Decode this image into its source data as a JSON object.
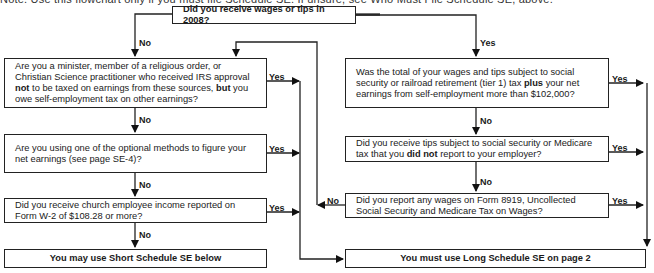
{
  "header_text": "Note. Use this flowchart only if you must file Schedule SE. If unsure, see Who Must File Schedule SE, above.",
  "flowchart": {
    "start": {
      "text": "Did you receive wages or tips in 2008?"
    },
    "left_column": [
      {
        "id": "minister",
        "parts": [
          "Are you a minister, member of a religious order, or Christian Science practitioner who received IRS approval ",
          "not",
          " to be taxed on earnings from these sources, ",
          "but",
          " you owe self-employment tax on other earnings?"
        ]
      },
      {
        "id": "optional-methods",
        "parts": [
          "Are you using one of the optional methods to figure your net earnings (see page SE-4)?"
        ]
      },
      {
        "id": "church-income",
        "parts": [
          "Did you receive church employee income reported on Form W-2 of $108.28 or more?"
        ]
      }
    ],
    "right_column": [
      {
        "id": "total-wages",
        "parts": [
          "Was the total of your wages and tips subject to social security or railroad retirement (tier 1) tax ",
          "plus",
          " your net earnings from self-employment more than $102,000?"
        ]
      },
      {
        "id": "unreported-tips",
        "parts": [
          "Did you receive tips subject to social security or Medicare tax that you ",
          "did not",
          " report to your employer?"
        ]
      },
      {
        "id": "form-8919",
        "parts": [
          "Did you report any wages on Form 8919, Uncollected Social Security and Medicare Tax on Wages?"
        ]
      }
    ],
    "outcomes": {
      "short": "You may use Short Schedule SE below",
      "long": "You must use Long Schedule SE on page 2"
    },
    "labels": {
      "yes": "Yes",
      "no": "No"
    }
  }
}
